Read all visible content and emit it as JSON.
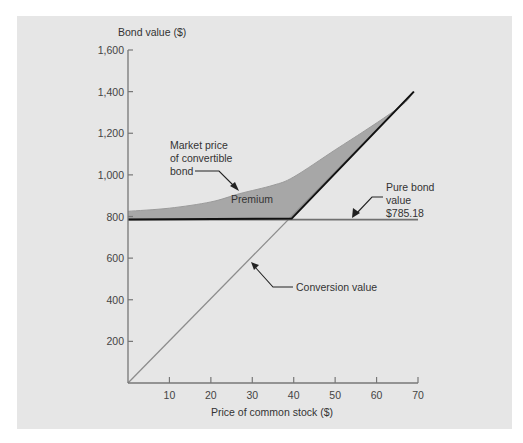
{
  "chart_data": {
    "type": "line",
    "title": "",
    "xlabel": "Price of common stock ($)",
    "ylabel": "Bond value ($)",
    "xlim": [
      0,
      70
    ],
    "ylim": [
      0,
      1600
    ],
    "x_ticks": [
      10,
      20,
      30,
      40,
      50,
      60,
      70
    ],
    "y_ticks": [
      200,
      400,
      600,
      800,
      1000,
      1200,
      1400,
      1600
    ],
    "y_tick_labels": [
      "200",
      "400",
      "600",
      "800",
      "1,000",
      "1,200",
      "1,400",
      "1,600"
    ],
    "grid": false,
    "series": [
      {
        "name": "Conversion value",
        "x": [
          0,
          10,
          20,
          30,
          39.5,
          50,
          60,
          69
        ],
        "y": [
          0,
          200,
          400,
          600,
          790,
          1000,
          1200,
          1400
        ],
        "color": "#8a8a8a"
      },
      {
        "name": "Pure bond value",
        "x": [
          0,
          70
        ],
        "y": [
          785.18,
          785.18
        ],
        "color": "#6e6e6e"
      },
      {
        "name": "Minimum value (floor)",
        "x": [
          0,
          39.5,
          69
        ],
        "y": [
          785.18,
          790,
          1400
        ],
        "color": "#111111"
      },
      {
        "name": "Market price of convertible bond",
        "x": [
          0,
          10,
          20,
          27,
          35,
          40,
          50,
          57,
          63,
          67
        ],
        "y": [
          825,
          840,
          870,
          910,
          950,
          990,
          1120,
          1210,
          1290,
          1350
        ],
        "color": "#9a9a9a"
      }
    ],
    "annotations": [
      {
        "text": "Market price\nof convertible\nbond",
        "target_x": 27,
        "target_y": 925
      },
      {
        "text": "Premium",
        "x": 30,
        "y": 880
      },
      {
        "text": "Pure bond\nvalue\n$785.18",
        "target_x": 54,
        "target_y": 785.18
      },
      {
        "text": "Conversion value",
        "target_x": 29.5,
        "target_y": 585
      }
    ],
    "shaded_region": {
      "name": "Premium",
      "between": [
        "Market price of convertible bond",
        "Minimum value (floor)"
      ],
      "color": "#a7a7a7"
    }
  },
  "labels": {
    "ylabel": "Bond value ($)",
    "xlabel": "Price of common stock ($)",
    "market_line1": "Market price",
    "market_line2": "of convertible",
    "market_line3": "bond",
    "premium": "Premium",
    "pure_line1": "Pure bond",
    "pure_line2": "value",
    "pure_line3": "$785.18",
    "conversion": "Conversion value"
  }
}
